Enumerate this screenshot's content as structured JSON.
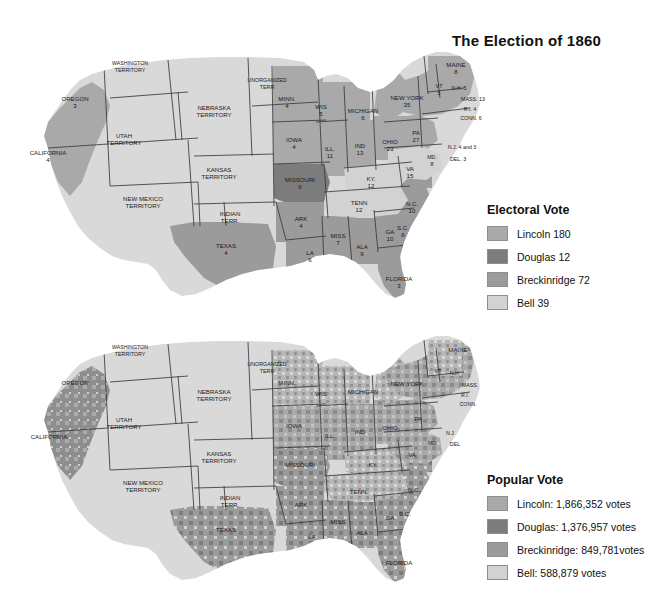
{
  "title": "The Election of 1860",
  "colors": {
    "lincoln": "#a9a9a9",
    "douglas": "#7c7c7c",
    "breckinridge": "#9b9b9b",
    "bell": "#d2d2d2",
    "territory": "#d9d9d9",
    "background": "#ffffff",
    "border": "#3a3a3a"
  },
  "legends": [
    {
      "id": "electoral",
      "heading": "Electoral Vote",
      "entries": [
        {
          "label": "Lincoln 180",
          "candidate": "Lincoln",
          "value": "180",
          "color": "#a9a9a9"
        },
        {
          "label": "Douglas 12",
          "candidate": "Douglas",
          "value": "12",
          "color": "#7c7c7c"
        },
        {
          "label": "Breckinridge 72",
          "candidate": "Breckinridge",
          "value": "72",
          "color": "#9b9b9b"
        },
        {
          "label": "Bell 39",
          "candidate": "Bell",
          "value": "39",
          "color": "#d2d2d2"
        }
      ]
    },
    {
      "id": "popular",
      "heading": "Popular Vote",
      "entries": [
        {
          "label": "Lincoln: 1,866,352 votes",
          "candidate": "Lincoln",
          "value": "1,866,352",
          "color": "#a9a9a9"
        },
        {
          "label": "Douglas: 1,376,957 votes",
          "candidate": "Douglas",
          "value": "1,376,957",
          "color": "#7c7c7c"
        },
        {
          "label": "Breckinridge: 849,781votes",
          "candidate": "Breckinridge",
          "value": "849,781",
          "color": "#9b9b9b"
        },
        {
          "label": "Bell: 588,879 votes",
          "candidate": "Bell",
          "value": "588,879",
          "color": "#d2d2d2"
        }
      ]
    }
  ],
  "electoral_map": {
    "name": "electoral-vote-map",
    "labels": [
      {
        "name": "washington-territory",
        "text": [
          "WASHINGTON",
          "TERRITORY"
        ],
        "x": 112,
        "y": 28,
        "size": "s5"
      },
      {
        "name": "oregon",
        "text": [
          "OREGON",
          "3"
        ],
        "x": 57,
        "y": 63,
        "size": "s6"
      },
      {
        "name": "california",
        "text": [
          "CALIFORNIA",
          "4"
        ],
        "x": 30,
        "y": 117,
        "size": "s6"
      },
      {
        "name": "utah-territory",
        "text": [
          "UTAH",
          "TERRITORY"
        ],
        "x": 106,
        "y": 100,
        "size": "s6"
      },
      {
        "name": "new-mexico-territory",
        "text": [
          "NEW MEXICO",
          "TERRITORY"
        ],
        "x": 125,
        "y": 163,
        "size": "s6"
      },
      {
        "name": "nebraska-territory",
        "text": [
          "NEBRASKA",
          "TERRITORY"
        ],
        "x": 196,
        "y": 72,
        "size": "s6"
      },
      {
        "name": "unorganized-terr",
        "text": [
          "UNORGANIZED",
          "TERR"
        ],
        "x": 249,
        "y": 45,
        "size": "s5"
      },
      {
        "name": "kansas-territory",
        "text": [
          "KANSAS",
          "TERRITORY"
        ],
        "x": 201,
        "y": 134,
        "size": "s6"
      },
      {
        "name": "indian-terr",
        "text": [
          "INDIAN",
          "TERR."
        ],
        "x": 212,
        "y": 178,
        "size": "s6"
      },
      {
        "name": "texas",
        "text": [
          "TEXAS",
          "4"
        ],
        "x": 208,
        "y": 210,
        "size": "s6"
      },
      {
        "name": "minn",
        "text": [
          "MINN.",
          "4"
        ],
        "x": 269,
        "y": 63,
        "size": "s6"
      },
      {
        "name": "wis",
        "text": [
          "WIS",
          "5"
        ],
        "x": 303,
        "y": 71,
        "size": "s6"
      },
      {
        "name": "iowa",
        "text": [
          "IOWA",
          "4"
        ],
        "x": 276,
        "y": 104,
        "size": "s6"
      },
      {
        "name": "missouri",
        "text": [
          "MISSOURI",
          "9"
        ],
        "x": 282,
        "y": 144,
        "size": "s6"
      },
      {
        "name": "ark",
        "text": [
          "ARK",
          "4"
        ],
        "x": 283,
        "y": 183,
        "size": "s6"
      },
      {
        "name": "la",
        "text": [
          "LA",
          "6"
        ],
        "x": 292,
        "y": 217,
        "size": "s6"
      },
      {
        "name": "miss",
        "text": [
          "MISS",
          "7"
        ],
        "x": 320,
        "y": 200,
        "size": "s6"
      },
      {
        "name": "ala",
        "text": [
          "ALA",
          "9"
        ],
        "x": 344,
        "y": 211,
        "size": "s6"
      },
      {
        "name": "ga",
        "text": [
          "GA",
          "10"
        ],
        "x": 372,
        "y": 196,
        "size": "s6"
      },
      {
        "name": "florida",
        "text": [
          "FLORIDA",
          "3"
        ],
        "x": 381,
        "y": 243,
        "size": "s6"
      },
      {
        "name": "michigan",
        "text": [
          "MICHIGAN",
          "6"
        ],
        "x": 345,
        "y": 75,
        "size": "s6"
      },
      {
        "name": "ill",
        "text": [
          "ILL.",
          "11"
        ],
        "x": 312,
        "y": 113,
        "size": "s6"
      },
      {
        "name": "ind",
        "text": [
          "IND",
          "13"
        ],
        "x": 342,
        "y": 110,
        "size": "s6"
      },
      {
        "name": "ohio",
        "text": [
          "OHIO",
          "23"
        ],
        "x": 372,
        "y": 106,
        "size": "s6"
      },
      {
        "name": "ky",
        "text": [
          "KY.",
          "12"
        ],
        "x": 353,
        "y": 143,
        "size": "s6"
      },
      {
        "name": "tenn",
        "text": [
          "TENN",
          "12"
        ],
        "x": 341,
        "y": 167,
        "size": "s6"
      },
      {
        "name": "va",
        "text": [
          "VA",
          "15"
        ],
        "x": 392,
        "y": 133,
        "size": "s6"
      },
      {
        "name": "nc",
        "text": [
          "N.C.",
          "10"
        ],
        "x": 394,
        "y": 168,
        "size": "s6"
      },
      {
        "name": "sc",
        "text": [
          "S.C.",
          "8"
        ],
        "x": 385,
        "y": 192,
        "size": "s6"
      },
      {
        "name": "new-york",
        "text": [
          "NEW YORK",
          "35"
        ],
        "x": 389,
        "y": 62,
        "size": "s6"
      },
      {
        "name": "maine",
        "text": [
          "MAINE",
          "8"
        ],
        "x": 438,
        "y": 29,
        "size": "s6"
      },
      {
        "name": "vt",
        "text": [
          "VT",
          "5"
        ],
        "x": 421,
        "y": 51,
        "size": "s5"
      },
      {
        "name": "nh",
        "text": [
          "N.H. 5"
        ],
        "x": 441,
        "y": 53,
        "size": "s5"
      },
      {
        "name": "mass",
        "text": [
          "MASS. 13"
        ],
        "x": 455,
        "y": 64,
        "size": "s5"
      },
      {
        "name": "ri",
        "text": [
          "R.I. 4"
        ],
        "x": 452,
        "y": 74,
        "size": "s5"
      },
      {
        "name": "conn",
        "text": [
          "CONN. 6"
        ],
        "x": 453,
        "y": 83,
        "size": "s5"
      },
      {
        "name": "pa",
        "text": [
          "PA",
          "27"
        ],
        "x": 398,
        "y": 97,
        "size": "s6"
      },
      {
        "name": "nj",
        "text": [
          "N.J. 4 and 3"
        ],
        "x": 444,
        "y": 112,
        "size": "s5"
      },
      {
        "name": "del",
        "text": [
          "DEL. 3"
        ],
        "x": 440,
        "y": 124,
        "size": "s5"
      },
      {
        "name": "md",
        "text": [
          "MD.",
          "8"
        ],
        "x": 414,
        "y": 122,
        "size": "s5"
      }
    ]
  },
  "popular_map": {
    "name": "popular-vote-map",
    "labels": [
      {
        "name": "washington-territory",
        "text": [
          "WASHINGTON",
          "TERRITORY"
        ],
        "x": 112,
        "y": 28,
        "size": "s5"
      },
      {
        "name": "oregon",
        "text": [
          "OREGON"
        ],
        "x": 57,
        "y": 63,
        "size": "s6"
      },
      {
        "name": "california",
        "text": [
          "CALIFORNIA"
        ],
        "x": 31,
        "y": 117,
        "size": "s6"
      },
      {
        "name": "utah-territory",
        "text": [
          "UTAH",
          "TERRITORY"
        ],
        "x": 106,
        "y": 100,
        "size": "s6"
      },
      {
        "name": "new-mexico-territory",
        "text": [
          "NEW MEXICO",
          "TERRITORY"
        ],
        "x": 125,
        "y": 163,
        "size": "s6"
      },
      {
        "name": "nebraska-territory",
        "text": [
          "NEBRASKA",
          "TERRITORY"
        ],
        "x": 196,
        "y": 72,
        "size": "s6"
      },
      {
        "name": "unorganized-terr",
        "text": [
          "UNORGANIZED",
          "TERR"
        ],
        "x": 249,
        "y": 45,
        "size": "s5"
      },
      {
        "name": "kansas-territory",
        "text": [
          "KANSAS",
          "TERRITORY"
        ],
        "x": 201,
        "y": 134,
        "size": "s6"
      },
      {
        "name": "indian-terr",
        "text": [
          "INDIAN",
          "TERR."
        ],
        "x": 212,
        "y": 178,
        "size": "s6"
      },
      {
        "name": "texas",
        "text": [
          "TEXAS"
        ],
        "x": 208,
        "y": 210,
        "size": "s6"
      },
      {
        "name": "minn",
        "text": [
          "MINN."
        ],
        "x": 269,
        "y": 63,
        "size": "s6"
      },
      {
        "name": "wis",
        "text": [
          "WIS"
        ],
        "x": 303,
        "y": 74,
        "size": "s6"
      },
      {
        "name": "iowa",
        "text": [
          "IOWA"
        ],
        "x": 276,
        "y": 106,
        "size": "s6"
      },
      {
        "name": "missouri",
        "text": [
          "MISSOURI"
        ],
        "x": 282,
        "y": 145,
        "size": "s6"
      },
      {
        "name": "ark",
        "text": [
          "ARK"
        ],
        "x": 283,
        "y": 185,
        "size": "s6"
      },
      {
        "name": "la",
        "text": [
          "LA"
        ],
        "x": 294,
        "y": 217,
        "size": "s6"
      },
      {
        "name": "miss",
        "text": [
          "MISS"
        ],
        "x": 320,
        "y": 202,
        "size": "s6"
      },
      {
        "name": "ala",
        "text": [
          "ALA"
        ],
        "x": 344,
        "y": 213,
        "size": "s6"
      },
      {
        "name": "ga",
        "text": [
          "GA"
        ],
        "x": 372,
        "y": 198,
        "size": "s6"
      },
      {
        "name": "florida",
        "text": [
          "FLORIDA"
        ],
        "x": 381,
        "y": 243,
        "size": "s6"
      },
      {
        "name": "michigan",
        "text": [
          "MICHIGAN"
        ],
        "x": 345,
        "y": 72,
        "size": "s6"
      },
      {
        "name": "ill",
        "text": [
          "ILL."
        ],
        "x": 312,
        "y": 116,
        "size": "s6"
      },
      {
        "name": "ind",
        "text": [
          "IND"
        ],
        "x": 342,
        "y": 112,
        "size": "s6"
      },
      {
        "name": "ohio",
        "text": [
          "OHIO"
        ],
        "x": 372,
        "y": 108,
        "size": "s6"
      },
      {
        "name": "ky",
        "text": [
          "KY."
        ],
        "x": 355,
        "y": 145,
        "size": "s6"
      },
      {
        "name": "tenn",
        "text": [
          "TENN."
        ],
        "x": 341,
        "y": 172,
        "size": "s6"
      },
      {
        "name": "va",
        "text": [
          "VA"
        ],
        "x": 394,
        "y": 135,
        "size": "s6"
      },
      {
        "name": "nc",
        "text": [
          "N.C."
        ],
        "x": 396,
        "y": 170,
        "size": "s6"
      },
      {
        "name": "sc",
        "text": [
          "S.C."
        ],
        "x": 387,
        "y": 194,
        "size": "s6"
      },
      {
        "name": "new-york",
        "text": [
          "NEW YORK"
        ],
        "x": 389,
        "y": 64,
        "size": "s6"
      },
      {
        "name": "maine",
        "text": [
          "MAINE"
        ],
        "x": 440,
        "y": 30,
        "size": "s6"
      },
      {
        "name": "vt",
        "text": [
          "VT"
        ],
        "x": 420,
        "y": 52,
        "size": "s5"
      },
      {
        "name": "nh",
        "text": [
          "N.H."
        ],
        "x": 437,
        "y": 54,
        "size": "s5"
      },
      {
        "name": "mass",
        "text": [
          "MASS."
        ],
        "x": 452,
        "y": 66,
        "size": "s5"
      },
      {
        "name": "ri",
        "text": [
          "R.I."
        ],
        "x": 447,
        "y": 76,
        "size": "s5"
      },
      {
        "name": "conn",
        "text": [
          "CONN."
        ],
        "x": 450,
        "y": 85,
        "size": "s5"
      },
      {
        "name": "pa",
        "text": [
          "PA"
        ],
        "x": 400,
        "y": 99,
        "size": "s6"
      },
      {
        "name": "nj",
        "text": [
          "N.J"
        ],
        "x": 432,
        "y": 114,
        "size": "s5"
      },
      {
        "name": "del",
        "text": [
          "DEL"
        ],
        "x": 437,
        "y": 125,
        "size": "s5"
      },
      {
        "name": "md",
        "text": [
          "MD"
        ],
        "x": 414,
        "y": 124,
        "size": "s5"
      }
    ]
  }
}
